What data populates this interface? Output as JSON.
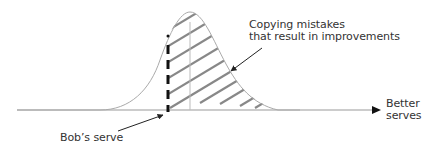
{
  "diagram": {
    "type": "normal-distribution-annotated",
    "curve": {
      "description": "bell curve of serve quality",
      "peak_x": 190
    },
    "labels": {
      "mistakes_line1": "Copying mistakes",
      "mistakes_line2": "that result in improvements",
      "bob": "Bob’s serve",
      "axis_line1": "Better",
      "axis_line2": "serves"
    },
    "colors": {
      "curve": "#aaaaaa",
      "axis": "#888888",
      "hatch": "#888888",
      "dashed_marker": "#111111",
      "arrows": "#222222",
      "text": "#333333"
    }
  }
}
